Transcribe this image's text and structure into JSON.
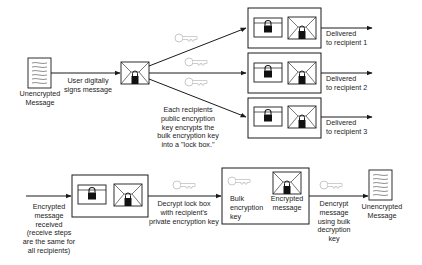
{
  "diagram": {
    "send": {
      "source_doc_label": [
        "Unencrypted",
        "Message"
      ],
      "sign_label": [
        "User digitally",
        "signs message"
      ],
      "lockbox_note": [
        "Each recipients",
        "public encryption",
        "key encrypts the",
        "bulk encryption key",
        "into a \"lock box.\""
      ],
      "recipients": [
        {
          "label": [
            "Delivered",
            "to recipient 1"
          ]
        },
        {
          "label": [
            "Delivered",
            "to recipient 2"
          ]
        },
        {
          "label": [
            "Delivered",
            "to recipient 3"
          ]
        }
      ]
    },
    "receive": {
      "received_label": [
        "Encrypted",
        "message",
        "received",
        "(receive steps",
        "are the same for",
        "all recipients)"
      ],
      "decrypt_lockbox_label": [
        "Decrypt lock box",
        "with recipient's",
        "private encryption key"
      ],
      "bulk_key_label": [
        "Bulk",
        "encryption",
        "key"
      ],
      "encrypted_msg_label": [
        "Encrypted",
        "message"
      ],
      "decrypt_msg_label": [
        "Dencrypt",
        "message",
        "using bulk",
        "decryption",
        "key"
      ],
      "output_doc_label": [
        "Unencrypted",
        "Message"
      ]
    },
    "icons": {
      "document": "document-icon",
      "envelope": "sealed-envelope-icon",
      "lockbox": "lock-box-icon",
      "key": "key-icon"
    },
    "colors": {
      "line": "#1a1a1a",
      "key": "#c8c8c8",
      "background": "#ffffff"
    }
  }
}
